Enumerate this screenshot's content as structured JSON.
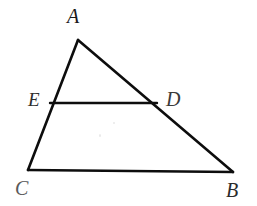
{
  "figure": {
    "kind": "geometry-diagram",
    "background_color": "#ffffff",
    "stroke_color": "#0d0d0d",
    "stroke_width": 2.6,
    "width": 257,
    "height": 206
  },
  "points": {
    "A": {
      "label": "A",
      "x": 78,
      "y": 40
    },
    "B": {
      "label": "B",
      "x": 233,
      "y": 172
    },
    "C": {
      "label": "C",
      "x": 28,
      "y": 170
    },
    "D": {
      "label": "D",
      "x": 157,
      "y": 103
    },
    "E": {
      "label": "E",
      "x": 50,
      "y": 103
    }
  },
  "labels": {
    "A": {
      "text": "A",
      "left": 67,
      "top": 6,
      "size": 20,
      "color": "#1a1a1a"
    },
    "B": {
      "text": "B",
      "left": 226,
      "top": 180,
      "size": 20,
      "color": "#2b2b2b"
    },
    "C": {
      "text": "C",
      "left": 15,
      "top": 178,
      "size": 20,
      "color": "#5a5a5a"
    },
    "D": {
      "text": "D",
      "left": 166,
      "top": 89,
      "size": 20,
      "color": "#3a3a3a"
    },
    "E": {
      "text": "E",
      "left": 28,
      "top": 90,
      "size": 19,
      "color": "#2e2e2e"
    }
  },
  "segments": [
    {
      "name": "side-AC",
      "from": "A",
      "to": "C"
    },
    {
      "name": "side-AB",
      "from": "A",
      "to": "B"
    },
    {
      "name": "side-CB",
      "from": "C",
      "to": "B"
    },
    {
      "name": "segment-ED",
      "from": "E",
      "to": "D"
    }
  ]
}
